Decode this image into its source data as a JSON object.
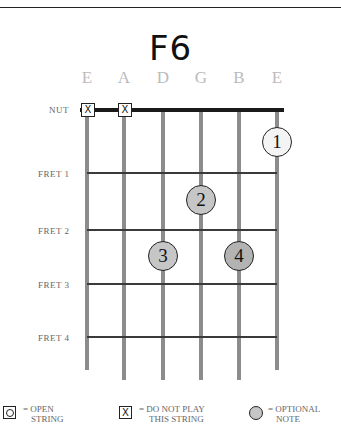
{
  "chord": {
    "name": "F6",
    "strings": [
      "E",
      "A",
      "D",
      "G",
      "B",
      "E"
    ],
    "nut_label": "NUT",
    "fret_labels": [
      "FRET 1",
      "FRET 2",
      "FRET 3",
      "FRET 4"
    ],
    "muted_strings": [
      0,
      1
    ],
    "fingers": [
      {
        "label": "1",
        "string": 5,
        "position": "nut-to-fret1",
        "fill": "#f4f4f4"
      },
      {
        "label": "2",
        "string": 3,
        "position": "fret1-to-fret2",
        "fill": "#c6c6c6"
      },
      {
        "label": "3",
        "string": 2,
        "position": "fret2-to-fret3",
        "fill": "#c6c6c6"
      },
      {
        "label": "4",
        "string": 4,
        "position": "fret2-to-fret3",
        "fill": "#b3b3b3"
      }
    ]
  },
  "legend": {
    "open": {
      "symbol": "O",
      "line1": "= OPEN",
      "line2": "STRING"
    },
    "mute": {
      "symbol": "X",
      "line1": "= DO NOT PLAY",
      "line2": "THIS STRING"
    },
    "optional": {
      "line1": "= OPTIONAL",
      "line2": "NOTE"
    }
  },
  "colors": {
    "string": "#8c8c8c",
    "fret": "#3a3a3a",
    "nut": "#1a1a1a",
    "optional": "#c6c6c6"
  }
}
